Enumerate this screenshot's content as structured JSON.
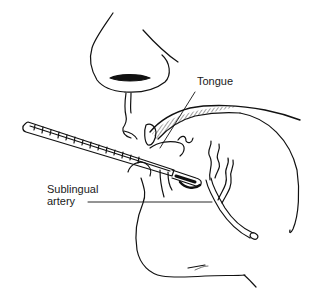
{
  "figure": {
    "labels": {
      "tongue": "Tongue",
      "sublingual_artery_line1": "Sublingual",
      "sublingual_artery_line2": "artery"
    },
    "colors": {
      "ink": "#111111",
      "background": "#ffffff",
      "label_text": "#1a1a1a"
    },
    "parts": [
      "nose",
      "nostril",
      "upper-lip",
      "lower-lip",
      "chin",
      "tongue",
      "thermometer",
      "sublingual-artery",
      "jaw-outline"
    ]
  }
}
